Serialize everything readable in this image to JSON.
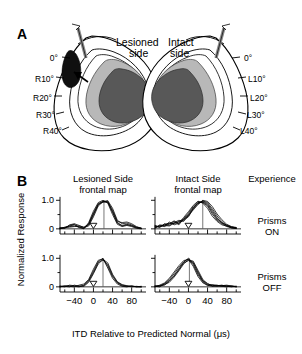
{
  "figure": {
    "panel_a": {
      "letter": "A",
      "left_title": "Lesioned\nside",
      "right_title": "Intact\nside",
      "left_labels": [
        "0°",
        "R10°",
        "R20°",
        "R30°",
        "R40°"
      ],
      "right_labels": [
        "0°",
        "L10°",
        "L20°",
        "L30°",
        "L40°"
      ],
      "colors": {
        "outline": "#000000",
        "lesion": "#101010",
        "light_gray": "#b8b8b8",
        "dark_gray": "#585858",
        "electrode": "#8a8a8a"
      }
    },
    "panel_b": {
      "letter": "B",
      "column_headers": [
        "Lesioned Side\nfrontal map",
        "Intact Side\nfrontal map",
        "Experience"
      ],
      "row_labels": [
        "Prisms\nON",
        "Prisms\nOFF"
      ],
      "ylabel": "Normalized Response",
      "xlabel": "ITD Relative to Predicted Normal (μs)"
    }
  },
  "chart_data": {
    "type": "line",
    "title": "",
    "xlabel": "ITD Relative to Predicted Normal (μs)",
    "ylabel": "Normalized Response",
    "xlim": [
      -70,
      110
    ],
    "ylim": [
      -0.25,
      1.15
    ],
    "xticks": [
      -40,
      0,
      40,
      80
    ],
    "xtick_labels": [
      "−40",
      "0",
      "40",
      "80"
    ],
    "xminor_step": 20,
    "yticks": [
      0,
      1.0
    ],
    "ytick_labels": [
      "0",
      "1.0"
    ],
    "yminor": [
      0.5
    ],
    "grid": false,
    "legend": false,
    "marker_symbol": "open-down-triangle",
    "marker_meaning": "predicted-normal-ITD",
    "panels": [
      {
        "id": "lesioned-prisms-on",
        "row": "Prisms ON",
        "column": "Lesioned Side frontal map",
        "marker_x": 0,
        "peak_center": 22,
        "series": [
          {
            "name": "unit-1",
            "x": [
              -70,
              -60,
              -50,
              -40,
              -30,
              -20,
              -10,
              0,
              10,
              20,
              30,
              40,
              50,
              60,
              70,
              80,
              90,
              100
            ],
            "values": [
              0.02,
              0.05,
              0.1,
              0.14,
              0.08,
              0.02,
              0.18,
              0.55,
              0.88,
              0.97,
              0.93,
              0.6,
              0.22,
              0.12,
              0.16,
              0.1,
              0.04,
              0.02
            ]
          },
          {
            "name": "unit-2",
            "x": [
              -70,
              -60,
              -50,
              -40,
              -30,
              -20,
              -10,
              0,
              10,
              20,
              30,
              40,
              50,
              60,
              70,
              80,
              90,
              100
            ],
            "values": [
              0.04,
              0.02,
              0.14,
              0.18,
              0.12,
              0.05,
              0.1,
              0.42,
              0.8,
              0.95,
              0.99,
              0.72,
              0.3,
              0.18,
              0.2,
              0.14,
              0.06,
              0.03
            ]
          },
          {
            "name": "unit-3",
            "x": [
              -70,
              -60,
              -50,
              -40,
              -30,
              -20,
              -10,
              0,
              10,
              20,
              30,
              40,
              50,
              60,
              70,
              80,
              90,
              100
            ],
            "values": [
              0.0,
              0.06,
              0.08,
              0.1,
              0.06,
              0.0,
              0.22,
              0.62,
              0.92,
              1.0,
              0.9,
              0.5,
              0.16,
              0.08,
              0.12,
              0.08,
              0.02,
              0.0
            ]
          },
          {
            "name": "unit-4",
            "x": [
              -70,
              -60,
              -50,
              -40,
              -30,
              -20,
              -10,
              0,
              10,
              20,
              30,
              40,
              50,
              60,
              70,
              80,
              90,
              100
            ],
            "values": [
              0.03,
              0.03,
              0.12,
              0.16,
              0.04,
              0.03,
              0.14,
              0.48,
              0.84,
              0.96,
              0.96,
              0.66,
              0.26,
              0.22,
              0.24,
              0.18,
              0.08,
              0.02
            ]
          },
          {
            "name": "unit-5",
            "x": [
              -70,
              -60,
              -50,
              -40,
              -30,
              -20,
              -10,
              0,
              10,
              20,
              30,
              40,
              50,
              60,
              70,
              80,
              90,
              100
            ],
            "values": [
              0.01,
              0.04,
              0.06,
              0.08,
              0.1,
              0.06,
              0.16,
              0.52,
              0.86,
              0.93,
              0.94,
              0.58,
              0.2,
              0.1,
              0.14,
              0.12,
              0.05,
              0.01
            ]
          }
        ]
      },
      {
        "id": "intact-prisms-on",
        "row": "Prisms ON",
        "column": "Intact Side frontal map",
        "marker_x": 0,
        "peak_center": 30,
        "series": [
          {
            "name": "unit-1",
            "x": [
              -70,
              -60,
              -50,
              -40,
              -30,
              -20,
              -10,
              0,
              10,
              20,
              30,
              40,
              50,
              60,
              70,
              80,
              90,
              100
            ],
            "values": [
              0.1,
              0.08,
              0.14,
              0.2,
              0.18,
              0.24,
              0.3,
              0.42,
              0.7,
              0.9,
              0.98,
              0.92,
              0.7,
              0.45,
              0.25,
              0.12,
              0.06,
              0.04
            ]
          },
          {
            "name": "unit-2",
            "x": [
              -70,
              -60,
              -50,
              -40,
              -30,
              -20,
              -10,
              0,
              10,
              20,
              30,
              40,
              50,
              60,
              70,
              80,
              90,
              100
            ],
            "values": [
              0.04,
              0.12,
              0.08,
              0.16,
              0.26,
              0.14,
              0.36,
              0.55,
              0.78,
              0.95,
              0.92,
              0.8,
              0.52,
              0.3,
              0.18,
              0.08,
              0.04,
              0.02
            ]
          },
          {
            "name": "unit-3",
            "x": [
              -70,
              -60,
              -50,
              -40,
              -30,
              -20,
              -10,
              0,
              10,
              20,
              30,
              40,
              50,
              60,
              70,
              80,
              90,
              100
            ],
            "values": [
              0.08,
              0.05,
              0.18,
              0.12,
              0.22,
              0.3,
              0.26,
              0.48,
              0.66,
              0.85,
              1.0,
              0.96,
              0.78,
              0.52,
              0.32,
              0.16,
              0.08,
              0.05
            ]
          },
          {
            "name": "unit-4",
            "x": [
              -70,
              -60,
              -50,
              -40,
              -30,
              -20,
              -10,
              0,
              10,
              20,
              30,
              40,
              50,
              60,
              70,
              80,
              90,
              100
            ],
            "values": [
              0.06,
              0.1,
              0.1,
              0.24,
              0.14,
              0.2,
              0.4,
              0.6,
              0.82,
              0.97,
              0.9,
              0.72,
              0.44,
              0.26,
              0.14,
              0.1,
              0.05,
              0.02
            ]
          },
          {
            "name": "unit-5",
            "x": [
              -70,
              -60,
              -50,
              -40,
              -30,
              -20,
              -10,
              0,
              10,
              20,
              30,
              40,
              50,
              60,
              70,
              80,
              90,
              100
            ],
            "values": [
              0.12,
              0.06,
              0.16,
              0.18,
              0.28,
              0.18,
              0.32,
              0.5,
              0.74,
              0.88,
              0.96,
              0.88,
              0.64,
              0.38,
              0.2,
              0.14,
              0.07,
              0.03
            ]
          },
          {
            "name": "unit-6",
            "x": [
              -70,
              -60,
              -50,
              -40,
              -30,
              -20,
              -10,
              0,
              10,
              20,
              30,
              40,
              50,
              60,
              70,
              80,
              90,
              100
            ],
            "values": [
              0.02,
              0.14,
              0.12,
              0.1,
              0.2,
              0.26,
              0.34,
              0.45,
              0.72,
              0.92,
              0.94,
              0.84,
              0.58,
              0.34,
              0.22,
              0.11,
              0.03,
              0.01
            ]
          }
        ]
      },
      {
        "id": "lesioned-prisms-off",
        "row": "Prisms OFF",
        "column": "Lesioned Side frontal map",
        "marker_x": 0,
        "peak_center": 20,
        "series": [
          {
            "name": "unit-1",
            "x": [
              -70,
              -60,
              -50,
              -40,
              -30,
              -20,
              -10,
              0,
              10,
              20,
              30,
              40,
              50,
              60,
              70,
              80,
              90,
              100
            ],
            "values": [
              0.0,
              0.02,
              0.04,
              0.02,
              0.0,
              0.06,
              0.22,
              0.55,
              0.88,
              1.0,
              0.72,
              0.36,
              0.14,
              0.04,
              0.02,
              0.02,
              0.0,
              0.0
            ]
          },
          {
            "name": "unit-2",
            "x": [
              -70,
              -60,
              -50,
              -40,
              -30,
              -20,
              -10,
              0,
              10,
              20,
              30,
              40,
              50,
              60,
              70,
              80,
              90,
              100
            ],
            "values": [
              0.02,
              0.0,
              0.06,
              0.04,
              0.03,
              0.02,
              0.16,
              0.46,
              0.8,
              0.96,
              0.84,
              0.44,
              0.18,
              0.08,
              0.04,
              0.0,
              0.02,
              0.0
            ]
          },
          {
            "name": "unit-3",
            "x": [
              -70,
              -60,
              -50,
              -40,
              -30,
              -20,
              -10,
              0,
              10,
              20,
              30,
              40,
              50,
              60,
              70,
              80,
              90,
              100
            ],
            "values": [
              0.0,
              0.04,
              0.02,
              0.0,
              0.06,
              0.1,
              0.26,
              0.62,
              0.93,
              0.98,
              0.66,
              0.3,
              0.1,
              0.02,
              0.0,
              0.04,
              0.0,
              0.02
            ]
          },
          {
            "name": "unit-4",
            "x": [
              -70,
              -60,
              -50,
              -40,
              -30,
              -20,
              -10,
              0,
              10,
              20,
              30,
              40,
              50,
              60,
              70,
              80,
              90,
              100
            ],
            "values": [
              0.03,
              0.02,
              0.0,
              0.06,
              0.02,
              0.04,
              0.2,
              0.5,
              0.85,
              0.94,
              0.78,
              0.4,
              0.16,
              0.06,
              0.03,
              0.02,
              0.01,
              0.0
            ]
          }
        ]
      },
      {
        "id": "intact-prisms-off",
        "row": "Prisms OFF",
        "column": "Intact Side frontal map",
        "marker_x": 0,
        "peak_center": 2,
        "series": [
          {
            "name": "unit-1",
            "x": [
              -70,
              -60,
              -50,
              -40,
              -30,
              -20,
              -10,
              0,
              10,
              20,
              30,
              40,
              50,
              60,
              70,
              80,
              90,
              100
            ],
            "values": [
              0.02,
              0.04,
              0.1,
              0.22,
              0.4,
              0.62,
              0.86,
              1.0,
              0.84,
              0.48,
              0.2,
              0.08,
              0.04,
              0.06,
              0.02,
              0.04,
              0.02,
              0.0
            ]
          },
          {
            "name": "unit-2",
            "x": [
              -70,
              -60,
              -50,
              -40,
              -30,
              -20,
              -10,
              0,
              10,
              20,
              30,
              40,
              50,
              60,
              70,
              80,
              90,
              100
            ],
            "values": [
              0.0,
              0.06,
              0.14,
              0.3,
              0.52,
              0.74,
              0.92,
              0.96,
              0.72,
              0.36,
              0.14,
              0.06,
              0.02,
              0.04,
              0.06,
              0.02,
              0.0,
              0.02
            ]
          },
          {
            "name": "unit-3",
            "x": [
              -70,
              -60,
              -50,
              -40,
              -30,
              -20,
              -10,
              0,
              10,
              20,
              30,
              40,
              50,
              60,
              70,
              80,
              90,
              100
            ],
            "values": [
              0.04,
              0.02,
              0.08,
              0.16,
              0.34,
              0.56,
              0.8,
              0.94,
              0.9,
              0.58,
              0.26,
              0.1,
              0.06,
              0.02,
              0.04,
              0.06,
              0.03,
              0.0
            ]
          },
          {
            "name": "unit-4",
            "x": [
              -70,
              -60,
              -50,
              -40,
              -30,
              -20,
              -10,
              0,
              10,
              20,
              30,
              40,
              50,
              60,
              70,
              80,
              90,
              100
            ],
            "values": [
              0.02,
              0.0,
              0.12,
              0.26,
              0.46,
              0.68,
              0.88,
              0.98,
              0.78,
              0.42,
              0.18,
              0.04,
              0.08,
              0.05,
              0.02,
              0.0,
              0.04,
              0.01
            ]
          },
          {
            "name": "unit-5",
            "x": [
              -70,
              -60,
              -50,
              -40,
              -30,
              -20,
              -10,
              0,
              10,
              20,
              30,
              40,
              50,
              60,
              70,
              80,
              90,
              100
            ],
            "values": [
              0.01,
              0.05,
              0.06,
              0.2,
              0.38,
              0.6,
              0.84,
              0.92,
              0.86,
              0.52,
              0.22,
              0.12,
              0.03,
              0.03,
              0.05,
              0.03,
              0.01,
              0.02
            ]
          }
        ]
      }
    ]
  }
}
